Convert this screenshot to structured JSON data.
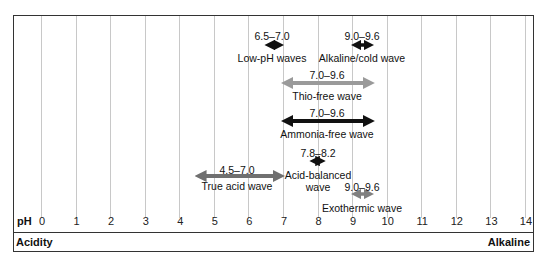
{
  "diagram": {
    "axis_label": "pH",
    "ticks": [
      "0",
      "1",
      "2",
      "3",
      "4",
      "5",
      "6",
      "7",
      "8",
      "9",
      "10",
      "11",
      "12",
      "13",
      "14"
    ],
    "left_footer": "Acidity",
    "right_footer": "Alkaline",
    "waves": [
      {
        "name": "Low-pH waves",
        "range": "6.5–7.0",
        "start": 6.5,
        "end": 7.0,
        "color": "#111111"
      },
      {
        "name": "Alkaline/cold wave",
        "range": "9.0–9.6",
        "start": 9.0,
        "end": 9.6,
        "color": "#111111"
      },
      {
        "name": "Thio-free wave",
        "range": "7.0–9.6",
        "start": 7.0,
        "end": 9.6,
        "color": "#9a9a9a"
      },
      {
        "name": "Ammonia-free wave",
        "range": "7.0–9.6",
        "start": 7.0,
        "end": 9.6,
        "color": "#111111"
      },
      {
        "name": "Acid-balanced wave",
        "range": "7.8–8.2",
        "start": 7.8,
        "end": 8.2,
        "color": "#111111"
      },
      {
        "name": "True acid wave",
        "range": "4.5–7.0",
        "start": 4.5,
        "end": 7.0,
        "color": "#707070"
      },
      {
        "name": "Exothermic wave",
        "range": "9.0–9.6",
        "start": 9.0,
        "end": 9.6,
        "color": "#808080"
      }
    ],
    "acid_balanced_line1": "Acid-balanced",
    "acid_balanced_line2": "wave"
  }
}
